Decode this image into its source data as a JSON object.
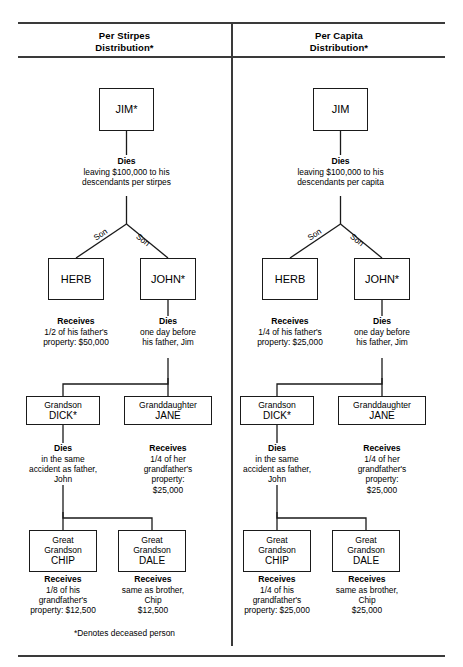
{
  "page": {
    "footnote": "*Denotes deceased person"
  },
  "columns": [
    {
      "id": "per-stirpes",
      "header_line1": "Per Stirpes",
      "header_line2": "Distribution*",
      "nodes": {
        "jim": {
          "name": "JIM*"
        },
        "herb": {
          "name": "HERB"
        },
        "john": {
          "name": "JOHN*"
        },
        "dick": {
          "role": "Grandson",
          "name": "DICK*"
        },
        "jane": {
          "role": "Granddaughter",
          "name": "JANE"
        },
        "chip": {
          "role1": "Great",
          "role2": "Grandson",
          "name": "CHIP"
        },
        "dale": {
          "role1": "Great",
          "role2": "Grandson",
          "name": "DALE"
        }
      },
      "notes": {
        "jim": {
          "head": "Dies",
          "body": "leaving $100,000 to his\ndescendants per stirpes"
        },
        "herb": {
          "head": "Receives",
          "body": "1/2 of his father's\nproperty: $50,000"
        },
        "john": {
          "head": "Dies",
          "body": "one day before\nhis father, Jim"
        },
        "dick": {
          "head": "Dies",
          "body": "in the same\naccident as father,\nJohn"
        },
        "jane": {
          "head": "Receives",
          "body": "1/4 of her\ngrandfather's\nproperty:\n$25,000"
        },
        "chip": {
          "head": "Receives",
          "body": "1/8 of his\ngrandfather's\nproperty: $12,500"
        },
        "dale": {
          "head": "Receives",
          "body": "same as brother,\nChip\n$12,500"
        }
      },
      "edge_labels": {
        "left": "Son",
        "right": "Son"
      }
    },
    {
      "id": "per-capita",
      "header_line1": "Per Capita",
      "header_line2": "Distribution*",
      "nodes": {
        "jim": {
          "name": "JIM"
        },
        "herb": {
          "name": "HERB"
        },
        "john": {
          "name": "JOHN*"
        },
        "dick": {
          "role": "Grandson",
          "name": "DICK*"
        },
        "jane": {
          "role": "Granddaughter",
          "name": "JANE"
        },
        "chip": {
          "role1": "Great",
          "role2": "Grandson",
          "name": "CHIP"
        },
        "dale": {
          "role1": "Great",
          "role2": "Grandson",
          "name": "DALE"
        }
      },
      "notes": {
        "jim": {
          "head": "Dies",
          "body": "leaving $100,000 to his\ndescendants per capita"
        },
        "herb": {
          "head": "Receives",
          "body": "1/4 of his father's\nproperty: $25,000"
        },
        "john": {
          "head": "Dies",
          "body": "one day before\nhis father, Jim"
        },
        "dick": {
          "head": "Dies",
          "body": "in the same\naccident as father,\nJohn"
        },
        "jane": {
          "head": "Receives",
          "body": "1/4 of her\ngrandfather's\nproperty:\n$25,000"
        },
        "chip": {
          "head": "Receives",
          "body": "1/4 of his\ngrandfather's\nproperty: $25,000"
        },
        "dale": {
          "head": "Receives",
          "body": "same as brother,\nChip\n$25,000"
        }
      },
      "edge_labels": {
        "left": "Son",
        "right": "Son"
      }
    }
  ]
}
